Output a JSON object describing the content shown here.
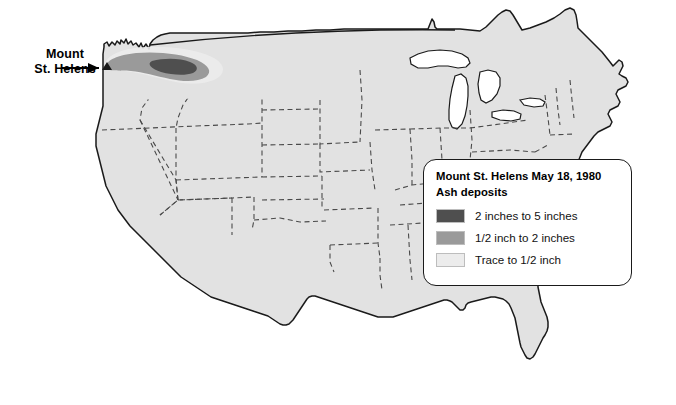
{
  "figure": {
    "name": "Mount St. Helens ash deposit map of the contiguous United States",
    "background_color": "#ffffff",
    "land_fill": "#e2e2e2",
    "coast_outline_color": "#1a1a1a",
    "state_border_color": "#4a4a4a",
    "state_border_style": "dashed"
  },
  "callout": {
    "name": "Mount St. Helens",
    "line1": "Mount",
    "line2": "St. Helens",
    "arrow": "arrow pointing right toward volcano site in southwest Washington"
  },
  "legend": {
    "title_line1": "Mount St. Helens May 18, 1980",
    "title_line2": "Ash deposits",
    "items": [
      {
        "label": "2 inches to 5 inches",
        "color": "#4f4f4f"
      },
      {
        "label": "1/2 inch to 2 inches",
        "color": "#9a9a9a"
      },
      {
        "label": "Trace to 1/2 inch",
        "color": "#ececec"
      }
    ]
  },
  "ash_plume": {
    "trace_layer_color": "#ececec",
    "half_to_two_inch_color": "#9a9a9a",
    "two_to_five_inch_color": "#4f4f4f",
    "description": "Elongated crescent-shaped ash plume extending east-northeast from southwest Washington across central Washington into northern Idaho"
  },
  "volcano_marker": {
    "color": "#1a1a1a",
    "symbol": "volcano-triangle"
  }
}
